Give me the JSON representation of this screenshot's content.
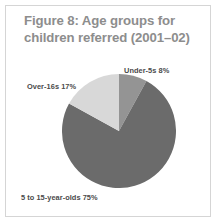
{
  "figure": {
    "title": "Figure 8: Age groups for children referred (2001–02)",
    "title_color": "#8d8d8d",
    "background": "#ffffff",
    "border_color": "#d5d5d5"
  },
  "labels": {
    "under5s": "Under-5s 8%",
    "over16s": "Over-16s 17%",
    "age5to15": "5 to 15-year-olds 75%"
  },
  "chart_data": {
    "type": "pie",
    "title": "Figure 8: Age groups for children referred (2001–02)",
    "categories": [
      "Under-5s",
      "5 to 15-year-olds",
      "Over-16s"
    ],
    "values": [
      8,
      75,
      17
    ],
    "value_unit": "%",
    "data_labels": [
      "Under-5s 8%",
      "5 to 15-year-olds 75%",
      "Over-16s 17%"
    ],
    "colors": [
      "#949494",
      "#6b6b6b",
      "#d8d8d8"
    ],
    "start_angle_deg": 0,
    "direction": "clockwise",
    "legend": "none",
    "grid": false,
    "label_positions": [
      "top-right",
      "bottom-left",
      "left"
    ]
  }
}
